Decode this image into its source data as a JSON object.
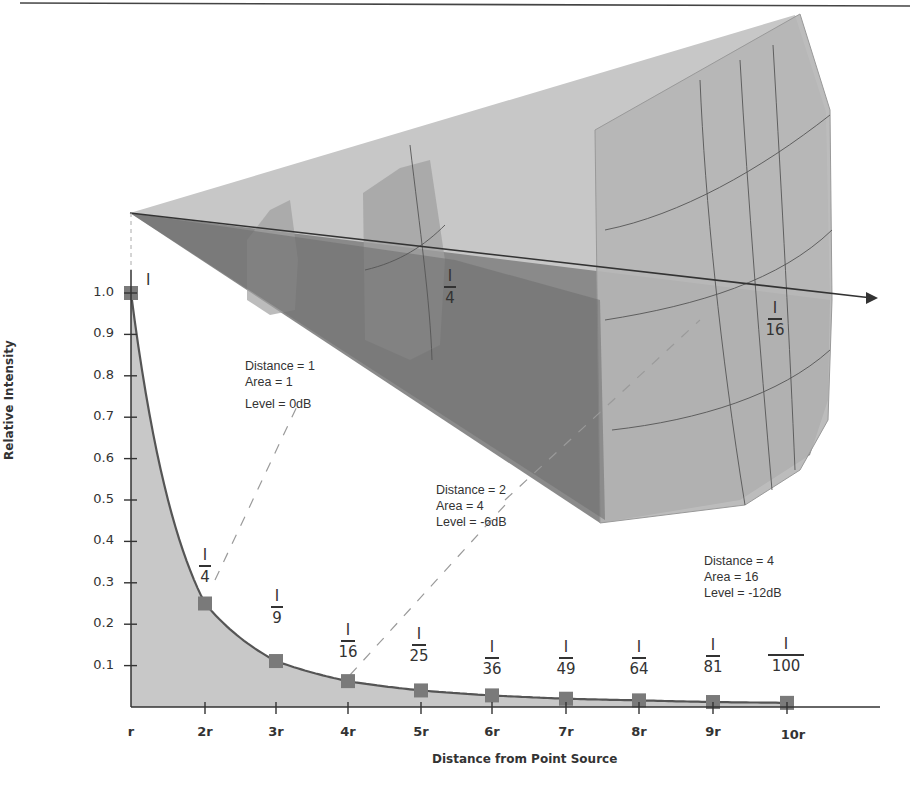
{
  "chart_data": {
    "type": "area",
    "title": "",
    "xlabel": "Distance from Point Source",
    "ylabel": "Relative Intensity",
    "categories": [
      "r",
      "2r",
      "3r",
      "4r",
      "5r",
      "6r",
      "7r",
      "8r",
      "9r",
      "10r"
    ],
    "values": [
      1.0,
      0.25,
      0.111,
      0.0625,
      0.04,
      0.028,
      0.02,
      0.016,
      0.012,
      0.01
    ],
    "point_labels": [
      {
        "num": "I",
        "den": ""
      },
      {
        "num": "I",
        "den": "4"
      },
      {
        "num": "I",
        "den": "9"
      },
      {
        "num": "I",
        "den": "16"
      },
      {
        "num": "I",
        "den": "25"
      },
      {
        "num": "I",
        "den": "36"
      },
      {
        "num": "I",
        "den": "49"
      },
      {
        "num": "I",
        "den": "64"
      },
      {
        "num": "I",
        "den": "81"
      },
      {
        "num": "I",
        "den": "100"
      }
    ],
    "y_ticks": [
      "1.0",
      "0.9",
      "0.8",
      "0.7",
      "0.6",
      "0.5",
      "0.4",
      "0.3",
      "0.2",
      "0.1"
    ],
    "ylim": [
      0,
      1.0
    ],
    "grid": false,
    "legend": null,
    "annotations": [
      {
        "lines": [
          "Distance = 1",
          "Area = 1",
          "Level = 0dB"
        ]
      },
      {
        "lines": [
          "Distance = 2",
          "Area = 4",
          "Level = -6dB"
        ]
      },
      {
        "lines": [
          "Distance = 4",
          "Area = 16",
          "Level = -12dB"
        ]
      }
    ],
    "cone_labels": [
      {
        "num": "I",
        "den": "4"
      },
      {
        "num": "I",
        "den": "16"
      }
    ]
  },
  "colors": {
    "fill": "#c8c8c8",
    "curve": "#555555",
    "marker": "#7a7a7a",
    "cone_light": "#c4c4c4",
    "cone_mid": "#a9a9a9",
    "cone_dark": "#7e7e7e",
    "text": "#333333"
  }
}
